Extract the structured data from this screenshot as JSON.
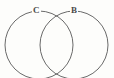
{
  "figure": {
    "kind": "venn-diagram",
    "title": "",
    "background_color": "#fdfdfb",
    "stroke_color": "#595959",
    "label_color": "#4a4a4a",
    "width": 114,
    "height": 78
  },
  "sets": [
    {
      "id": "left",
      "label": "C",
      "center_x": 39,
      "center_y": 45,
      "radius": 34,
      "label_x": 36,
      "label_y": 11
    },
    {
      "id": "right",
      "label": "B",
      "center_x": 74,
      "center_y": 45,
      "radius": 34,
      "label_x": 74,
      "label_y": 11
    }
  ],
  "chart_data": {
    "type": "diagram",
    "diagram_type": "venn",
    "title": "",
    "xlabel": "",
    "ylabel": "",
    "circles": [
      {
        "label": "C",
        "cx": 39,
        "cy": 45,
        "r": 34
      },
      {
        "label": "B",
        "cx": 74,
        "cy": 45,
        "r": 34
      }
    ],
    "regions": [
      "C only",
      "C and B",
      "B only"
    ],
    "annotations": [
      "C",
      "B"
    ]
  }
}
